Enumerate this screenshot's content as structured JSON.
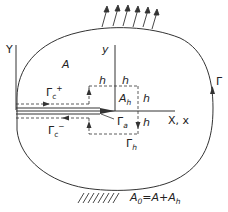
{
  "diagram": {
    "type": "fracture-mechanics-domain",
    "colors": {
      "stroke": "#333333",
      "label": "#222222",
      "background": "#ffffff"
    },
    "labels": {
      "global_y_axis": "Y",
      "local_y_axis": "y",
      "x_axis": "X, x",
      "region_a": "A",
      "region_ah": {
        "base": "A",
        "sub": "h"
      },
      "outer_contour": "Γ",
      "crack_upper_face": {
        "base": "Γ",
        "sub": "c",
        "sup": "+"
      },
      "crack_lower_face": {
        "base": "Γ",
        "sub": "c",
        "sup": "−"
      },
      "crack_tip_contour": {
        "base": "Γ",
        "sub": "a"
      },
      "box_contour": {
        "base": "Γ",
        "sub": "h"
      },
      "h_top_left": "h",
      "h_top_right": "h",
      "h_right_upper": "h",
      "h_right_lower": "h",
      "area_relation": {
        "a0": "A",
        "a0_sub": "0",
        "eq": "=A+A",
        "eq_sub": "h"
      }
    },
    "annotations": {
      "traction_arrows_count": 6,
      "fixed_support": "hatched-ground"
    }
  }
}
